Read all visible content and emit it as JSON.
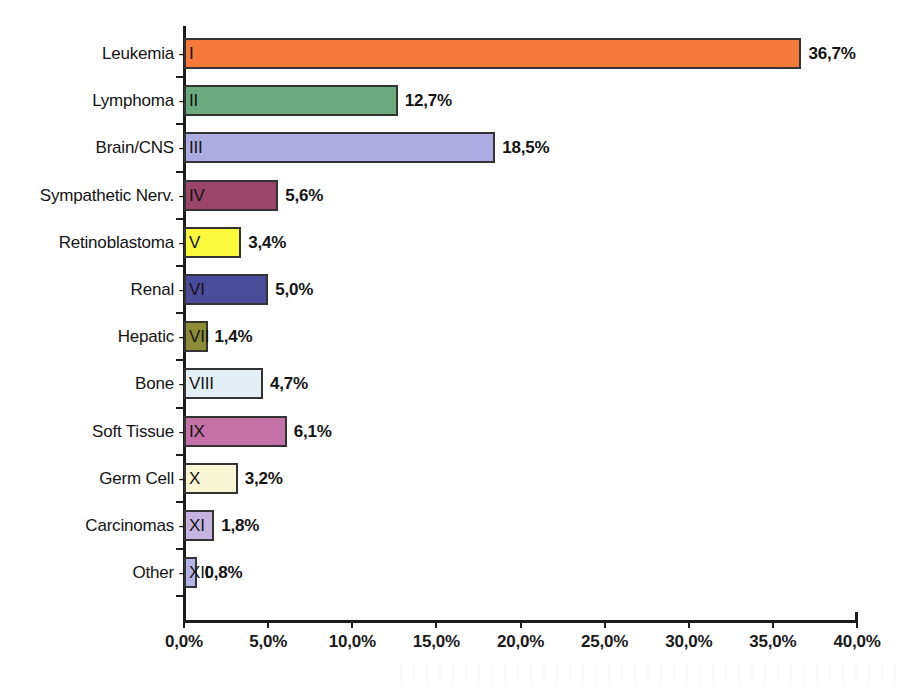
{
  "chart_data": {
    "type": "bar",
    "orientation": "horizontal",
    "title": "",
    "xlabel": "",
    "ylabel": "",
    "xlim": [
      0,
      40
    ],
    "xticks": [
      "0,0%",
      "5,0%",
      "10,0%",
      "15,0%",
      "20,0%",
      "25,0%",
      "30,0%",
      "35,0%",
      "40,0%"
    ],
    "xtick_values": [
      0,
      5,
      10,
      15,
      20,
      25,
      30,
      35,
      40
    ],
    "grid": false,
    "legend": "none",
    "value_suffix": "%",
    "decimal_separator": ",",
    "categories": [
      "Leukemia - I",
      "Lymphoma - II",
      "Brain/CNS - III",
      "Sympathetic Nerv. - IV",
      "Retinoblastoma - V",
      "Renal - VI",
      "Hepatic - VII",
      "Bone - VIII",
      "Soft Tissue - IX",
      "Germ Cell - X",
      "Carcinomas - XI",
      "Other - XII"
    ],
    "values": [
      36.7,
      12.7,
      18.5,
      5.6,
      3.4,
      5.0,
      1.4,
      4.7,
      6.1,
      3.2,
      1.8,
      0.8
    ],
    "value_labels": [
      "36,7%",
      "12,7%",
      "18,5%",
      "5,6%",
      "3,4%",
      "5,0%",
      "1,4%",
      "4,7%",
      "6,1%",
      "3,2%",
      "1,8%",
      "0,8%"
    ],
    "bars": [
      {
        "name": "Leukemia",
        "roman": "I",
        "label_text": "Leukemia -",
        "value": 36.7,
        "value_label": "36,7%",
        "color": "#F4793B"
      },
      {
        "name": "Lymphoma",
        "roman": "II",
        "label_text": "Lymphoma -",
        "value": 12.7,
        "value_label": "12,7%",
        "color": "#6BA97F"
      },
      {
        "name": "Brain/CNS",
        "roman": "III",
        "label_text": "Brain/CNS -",
        "value": 18.5,
        "value_label": "18,5%",
        "color": "#ACACE2"
      },
      {
        "name": "Sympathetic Nerv.",
        "roman": "IV",
        "label_text": "Sympathetic Nerv. -",
        "value": 5.6,
        "value_label": "5,6%",
        "color": "#9A4569"
      },
      {
        "name": "Retinoblastoma",
        "roman": "V",
        "label_text": "Retinoblastoma -",
        "value": 3.4,
        "value_label": "3,4%",
        "color": "#FBF93C"
      },
      {
        "name": "Renal",
        "roman": "VI",
        "label_text": "Renal -",
        "value": 5.0,
        "value_label": "5,0%",
        "color": "#4B4B9B"
      },
      {
        "name": "Hepatic",
        "roman": "VII",
        "label_text": "Hepatic -",
        "value": 1.4,
        "value_label": "1,4%",
        "color": "#8D8C36"
      },
      {
        "name": "Bone",
        "roman": "VIII",
        "label_text": "Bone -",
        "value": 4.7,
        "value_label": "4,7%",
        "color": "#E4EFF5"
      },
      {
        "name": "Soft Tissue",
        "roman": "IX",
        "label_text": "Soft Tissue -",
        "value": 6.1,
        "value_label": "6,1%",
        "color": "#C471A8"
      },
      {
        "name": "Germ Cell",
        "roman": "X",
        "label_text": "Germ Cell -",
        "value": 3.2,
        "value_label": "3,2%",
        "color": "#F7F7D5"
      },
      {
        "name": "Carcinomas",
        "roman": "XI",
        "label_text": "Carcinomas -",
        "value": 1.8,
        "value_label": "1,8%",
        "color": "#C5B4E0"
      },
      {
        "name": "Other",
        "roman": "XII",
        "label_text": "Other -",
        "value": 0.8,
        "value_label": "0,8%",
        "color": "#B3B3E6"
      }
    ]
  },
  "style": {
    "axis_color": "#1C1C1C",
    "bar_border_color": "#333333",
    "background": "#FFFFFF",
    "text_color": "#141414"
  }
}
